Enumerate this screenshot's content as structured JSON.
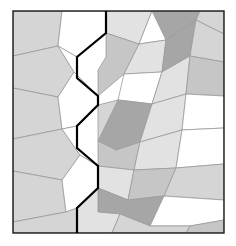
{
  "figure": {
    "name": "polygon-tiling-figure",
    "type": "geometric-tessellation-diagram",
    "width": 236,
    "height": 246,
    "background_color": "#ffffff"
  },
  "frame": {
    "x": 13,
    "y": 11,
    "width": 211,
    "height": 222,
    "stroke_color": "#1a1a1a",
    "stroke_width": 1.4,
    "fill_color": "#ffffff"
  },
  "palette": {
    "white": "#ffffff",
    "light_gray": "#d5d5d5",
    "pale_gray": "#e2e2e2",
    "mid_gray": "#c6c6c6",
    "dark_gray": "#a6a6a6",
    "tile_outline": "#9a9a9a",
    "frame_line": "#1a1a1a",
    "zigzag_line": "#000000"
  },
  "zigzag": {
    "name": "bold-zigzag-boundary",
    "stroke_color": "#000000",
    "stroke_width": 2.2,
    "points": "106,11 106,33 77,57 77,78 98,96 98,105 77,126 77,148 98,166 98,188 77,208 77,233"
  },
  "tiles": [
    {
      "id": "t01",
      "fill": "light_gray",
      "points": "13,11 62,11 58,46 13,56"
    },
    {
      "id": "t02",
      "fill": "white",
      "points": "62,11 106,11 106,33 77,57 58,46"
    },
    {
      "id": "t03",
      "fill": "light_gray",
      "points": "13,56 58,46 74,72 58,97 13,88"
    },
    {
      "id": "t04",
      "fill": "white",
      "points": "58,46 77,57 77,78 98,96 74,72"
    },
    {
      "id": "t05",
      "fill": "light_gray",
      "points": "13,88 58,97 62,129 13,139"
    },
    {
      "id": "t06",
      "fill": "white",
      "points": "58,97 74,72 98,96 98,105 77,126 62,129"
    },
    {
      "id": "t07",
      "fill": "light_gray",
      "points": "13,139 62,129 80,155 62,180 13,171"
    },
    {
      "id": "t08",
      "fill": "white",
      "points": "62,129 77,126 77,148 98,166 80,155"
    },
    {
      "id": "t09",
      "fill": "light_gray",
      "points": "13,171 62,180 66,212 13,222"
    },
    {
      "id": "t10",
      "fill": "white",
      "points": "62,180 80,155 98,166 98,188 77,208 66,212"
    },
    {
      "id": "t11",
      "fill": "light_gray",
      "points": "13,222 66,212 77,208 77,233 13,233"
    },
    {
      "id": "t12",
      "fill": "pale_gray",
      "points": "106,11 152,11 139,44 106,33"
    },
    {
      "id": "t13",
      "fill": "white",
      "points": "152,11 176,11 166,40 139,44"
    },
    {
      "id": "t14",
      "fill": "dark_gray",
      "points": "176,11 200,11 196,20 166,40 152,11"
    },
    {
      "id": "t15",
      "fill": "light_gray",
      "points": "200,11 224,11 224,34 196,20"
    },
    {
      "id": "t16",
      "fill": "mid_gray",
      "points": "106,33 139,44 124,74 98,96 98,70 106,57"
    },
    {
      "id": "t17",
      "fill": "pale_gray",
      "points": "139,44 166,40 162,72 124,74"
    },
    {
      "id": "t18",
      "fill": "dark_gray",
      "points": "166,40 196,20 190,56 162,72"
    },
    {
      "id": "t19",
      "fill": "light_gray",
      "points": "196,20 224,34 224,62 190,56"
    },
    {
      "id": "t20",
      "fill": "white",
      "points": "124,74 162,72 152,104 118,100"
    },
    {
      "id": "t21",
      "fill": "pale_gray",
      "points": "162,72 190,56 186,94 152,104"
    },
    {
      "id": "t22",
      "fill": "mid_gray",
      "points": "190,56 224,62 224,96 186,94"
    },
    {
      "id": "t23",
      "fill": "light_gray",
      "points": "98,105 118,100 124,131 98,141"
    },
    {
      "id": "t24",
      "fill": "dark_gray",
      "points": "98,141 118,100 152,104 140,142 116,150"
    },
    {
      "id": "t25",
      "fill": "pale_gray",
      "points": "152,104 186,94 182,130 140,142"
    },
    {
      "id": "t26",
      "fill": "white",
      "points": "186,94 224,96 224,128 182,130"
    },
    {
      "id": "t27",
      "fill": "mid_gray",
      "points": "98,141 116,150 140,142 134,170 98,166"
    },
    {
      "id": "t28",
      "fill": "pale_gray",
      "points": "140,142 182,130 176,168 134,170"
    },
    {
      "id": "t29",
      "fill": "white",
      "points": "182,130 224,128 224,164 176,168"
    },
    {
      "id": "t30",
      "fill": "pale_gray",
      "points": "98,166 134,170 128,200 98,188"
    },
    {
      "id": "t31",
      "fill": "mid_gray",
      "points": "134,170 176,168 164,196 128,200"
    },
    {
      "id": "t32",
      "fill": "light_gray",
      "points": "176,168 224,164 224,200 164,196"
    },
    {
      "id": "t33",
      "fill": "dark_gray",
      "points": "98,188 128,200 164,196 150,226 120,214 98,212"
    },
    {
      "id": "t34",
      "fill": "white",
      "points": "164,196 224,200 224,220 190,226 150,226"
    },
    {
      "id": "t35",
      "fill": "pale_gray",
      "points": "77,208 98,188 98,212 120,214 112,233 77,233"
    },
    {
      "id": "t36",
      "fill": "light_gray",
      "points": "120,214 150,226 190,226 186,233 112,233"
    },
    {
      "id": "t37",
      "fill": "mid_gray",
      "points": "190,226 224,220 224,233 186,233"
    }
  ]
}
